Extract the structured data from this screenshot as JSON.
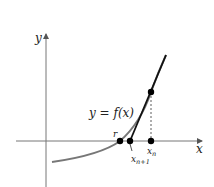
{
  "diagram": {
    "axes": {
      "x_label": "x",
      "y_label": "y"
    },
    "curve": {
      "label": "y = f(x)",
      "color": "#777777"
    },
    "tangent": {
      "color": "#111111"
    },
    "points": {
      "root_label": "r",
      "xn_label": "x",
      "xn_sub": "n",
      "xn1_label": "x",
      "xn1_sub": "n+1"
    },
    "colors": {
      "axis": "#666666",
      "dot": "#000000",
      "dashed": "#333333"
    }
  }
}
